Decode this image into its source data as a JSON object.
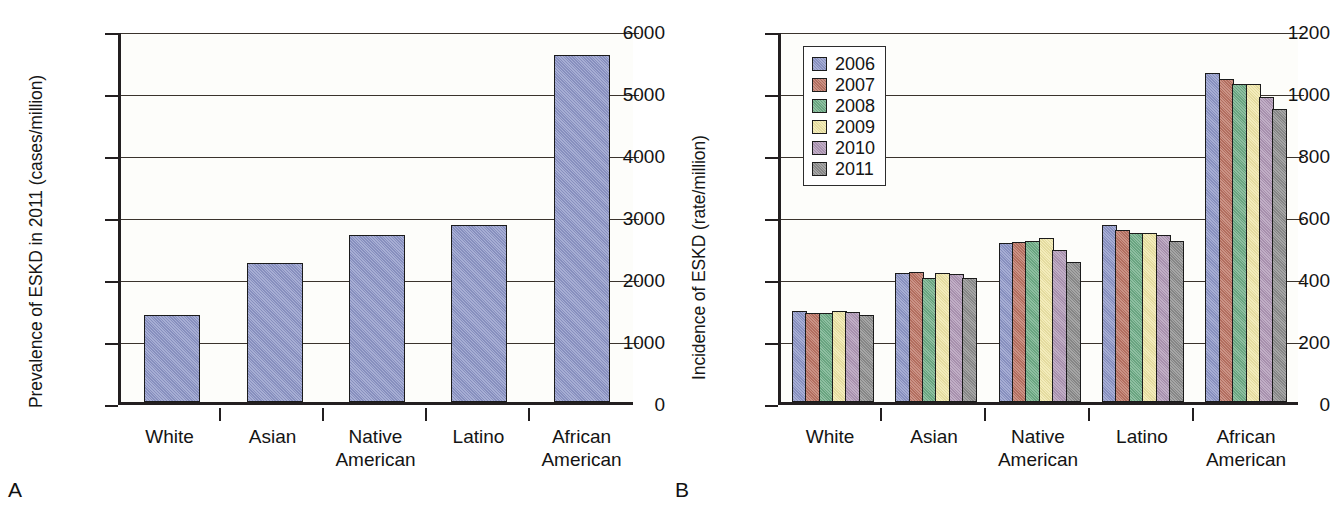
{
  "figure": {
    "panels": [
      {
        "letter": "A",
        "ylabel": "Prevalence of ESKD in 2011 (cases/million)"
      },
      {
        "letter": "B",
        "ylabel": "Incidence of ESKD (rate/million)"
      }
    ]
  },
  "colors": {
    "bar_blue": "#8e97c8",
    "series_2006": "#8e97c8",
    "series_2007": "#bc7464",
    "series_2008": "#6fad87",
    "series_2009": "#f0e7a8",
    "series_2010": "#b098b6",
    "series_2011": "#8d8d8d",
    "axis": "#231f20",
    "grid": "#3a332c",
    "plot_background": "#fdfdfa"
  },
  "chart_data": [
    {
      "type": "bar",
      "panel": "A",
      "title": "",
      "xlabel": "",
      "ylabel": "Prevalence of ESKD in 2011 (cases/million)",
      "ylim": [
        0,
        6000
      ],
      "yticks": [
        0,
        1000,
        2000,
        3000,
        4000,
        5000,
        6000
      ],
      "ytick_labels": [
        "0",
        "1000",
        "2000",
        "3000",
        "4000",
        "5000",
        "6000"
      ],
      "grid": true,
      "legend": false,
      "categories": [
        "White",
        "Asian",
        "Native American",
        "Latino",
        "African American"
      ],
      "category_lines": [
        [
          "White"
        ],
        [
          "Asian"
        ],
        [
          "Native",
          "American"
        ],
        [
          "Latino"
        ],
        [
          "African",
          "American"
        ]
      ],
      "values": [
        1400,
        2250,
        2700,
        2850,
        5600
      ]
    },
    {
      "type": "bar",
      "panel": "B",
      "title": "",
      "xlabel": "",
      "ylabel": "Incidence of ESKD (rate/million)",
      "ylim": [
        0,
        1200
      ],
      "yticks": [
        0,
        200,
        400,
        600,
        800,
        1000,
        1200
      ],
      "ytick_labels": [
        "0",
        "200",
        "400",
        "600",
        "800",
        "1000",
        "1200"
      ],
      "grid": true,
      "legend": true,
      "legend_position": "upper left",
      "legend_entries": [
        "2006",
        "2007",
        "2008",
        "2009",
        "2010",
        "2011"
      ],
      "categories": [
        "White",
        "Asian",
        "Native American",
        "Latino",
        "African American"
      ],
      "category_lines": [
        [
          "White"
        ],
        [
          "Asian"
        ],
        [
          "Native",
          "American"
        ],
        [
          "Latino"
        ],
        [
          "African",
          "American"
        ]
      ],
      "series": [
        {
          "name": "2006",
          "color": "#8e97c8",
          "values": [
            295,
            415,
            512,
            572,
            1060
          ]
        },
        {
          "name": "2007",
          "color": "#bc7464",
          "values": [
            288,
            418,
            515,
            555,
            1043
          ]
        },
        {
          "name": "2008",
          "color": "#6fad87",
          "values": [
            287,
            400,
            518,
            545,
            1025
          ]
        },
        {
          "name": "2009",
          "color": "#f0e7a8",
          "values": [
            292,
            415,
            528,
            545,
            1027
          ]
        },
        {
          "name": "2010",
          "color": "#b098b6",
          "values": [
            290,
            412,
            490,
            540,
            985
          ]
        },
        {
          "name": "2011",
          "color": "#8d8d8d",
          "values": [
            282,
            400,
            452,
            520,
            945
          ]
        }
      ]
    }
  ]
}
